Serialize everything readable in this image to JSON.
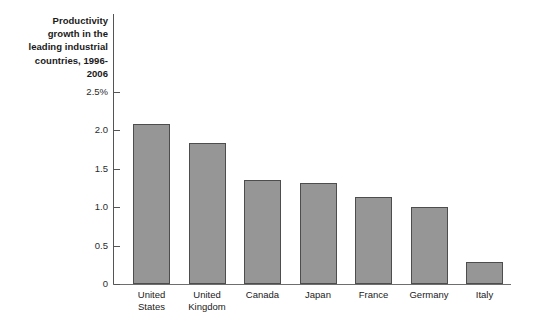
{
  "chart_data": {
    "type": "bar",
    "title": "Productivity\ngrowth in the\nleading industrial\ncountries, 1996-2006",
    "title_plain": "Productivity growth in the leading industrial countries, 1996-2006",
    "categories": [
      "United States",
      "United Kingdom",
      "Canada",
      "Japan",
      "France",
      "Germany",
      "Italy"
    ],
    "category_labels_wrapped": [
      "United\nStates",
      "United\nKingdom",
      "Canada",
      "Japan",
      "France",
      "Germany",
      "Italy"
    ],
    "values": [
      2.08,
      1.83,
      1.35,
      1.31,
      1.13,
      1.0,
      0.29
    ],
    "xlabel": "",
    "ylabel": "",
    "ylim": [
      0,
      2.5
    ],
    "yticks": [
      0,
      0.5,
      1.0,
      1.5,
      2.0,
      2.5
    ],
    "ytick_labels": [
      "0",
      "0.5",
      "1.0",
      "1.5",
      "2.0",
      "2.5%"
    ],
    "grid": false,
    "legend": false,
    "units": "percent",
    "bar_color": "#969696",
    "bar_edge_color": "#4d4d4d",
    "axis_color": "#555555"
  }
}
